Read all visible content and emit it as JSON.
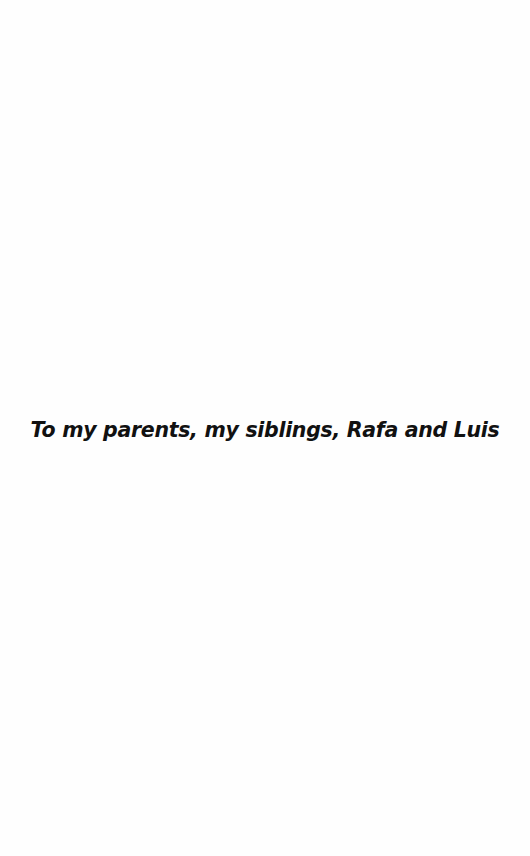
{
  "page": {
    "type": "dedication",
    "background_color": "#fefefe",
    "text_color": "#111111"
  },
  "dedication": {
    "text": "To my parents, my siblings, Rafa and Luis"
  }
}
